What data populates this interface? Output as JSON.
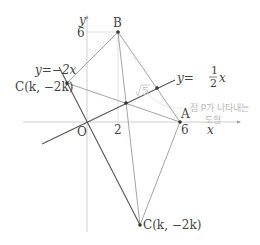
{
  "figure": {
    "axes": {
      "x_label": "x",
      "y_label": "y",
      "origin_label": "O",
      "x_ticks": [
        {
          "value": 2,
          "label": "2"
        },
        {
          "value": 6,
          "label": "6"
        }
      ],
      "y_ticks": [
        {
          "value": 6,
          "label": "6"
        }
      ]
    },
    "lines": {
      "line_neg2x": {
        "label": "y=−2x",
        "prefix": "y=−2",
        "var": "x"
      },
      "line_half_x": {
        "label": "y=1/2x",
        "prefix": "y=",
        "num": "1",
        "den": "2",
        "var": "x"
      }
    },
    "points": {
      "A": {
        "label": "A",
        "x": 6,
        "y": 0
      },
      "B": {
        "label": "B",
        "x": 2,
        "y": 6
      },
      "C_upper": {
        "label": "C(k, −2k)"
      },
      "C_lower": {
        "label": "C(k, −2k)"
      }
    },
    "annotations": {
      "sqrt5": "√5",
      "sqrt5_radicand": "5",
      "locus_line1": "점 P가 나타내는",
      "locus_line2": "도형"
    },
    "colors": {
      "axis": "#cfcfcf",
      "line_dark": "#555555",
      "line_light": "#9a9a9a",
      "text": "#444444",
      "faint": "#bdbdbd"
    }
  }
}
